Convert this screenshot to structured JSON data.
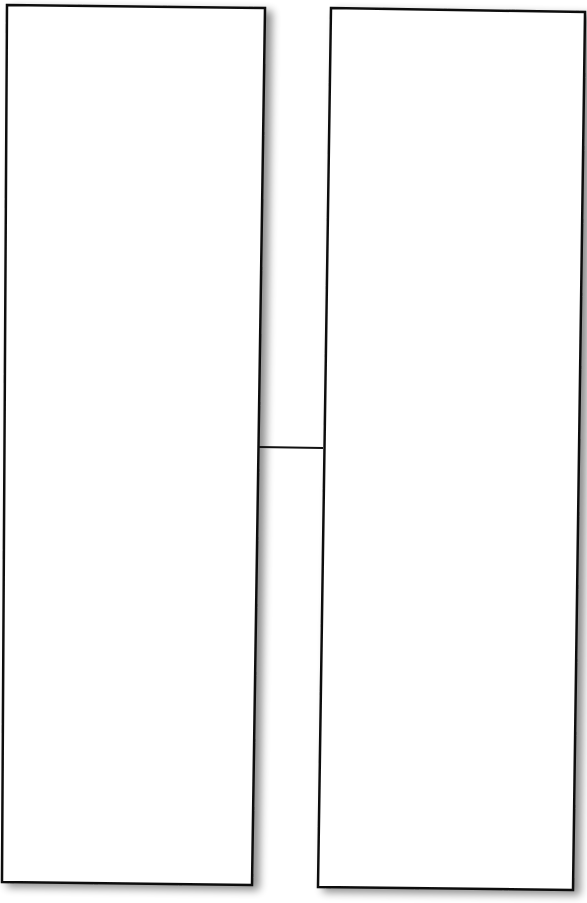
{
  "diagram": {
    "type": "two-boxes-connected",
    "background": "#ffffff",
    "stroke_color": "#111111",
    "shadow_color": "#9a9a9a",
    "boxes": [
      {
        "id": "left-box",
        "label": "",
        "fill": "#ffffff",
        "points": [
          [
            7,
            5
          ],
          [
            265,
            8
          ],
          [
            252,
            885
          ],
          [
            2,
            882
          ]
        ]
      },
      {
        "id": "right-box",
        "label": "",
        "fill": "#ffffff",
        "points": [
          [
            331,
            8
          ],
          [
            585,
            12
          ],
          [
            573,
            890
          ],
          [
            318,
            887
          ]
        ]
      }
    ],
    "connectors": [
      {
        "id": "left-to-right",
        "from": "left-box",
        "to": "right-box",
        "x1": 258,
        "y1": 447,
        "x2": 323,
        "y2": 448
      }
    ]
  }
}
